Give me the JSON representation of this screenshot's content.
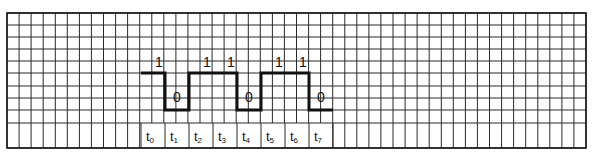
{
  "diagram": {
    "grid": {
      "left": 7,
      "top": 13,
      "right": 586,
      "bottom": 148,
      "col_width": 12.06,
      "row_lines": [
        13,
        25,
        37,
        49,
        61,
        73,
        86,
        98,
        110,
        123,
        148
      ],
      "label_row_top": 123,
      "line_color": "#2a2a2a"
    },
    "signal": {
      "start_x": 141,
      "slot_width": 24,
      "high_y": 73,
      "low_y": 110,
      "color": "#111111",
      "bits": [
        1,
        0,
        1,
        1,
        0,
        1,
        1,
        0
      ]
    },
    "bit_labels": [
      "1",
      "0",
      "1",
      "1",
      "0",
      "1",
      "1",
      "0"
    ],
    "time_labels": [
      {
        "base": "t",
        "sub": "0"
      },
      {
        "base": "t",
        "sub": "1"
      },
      {
        "base": "t",
        "sub": "2"
      },
      {
        "base": "t",
        "sub": "3"
      },
      {
        "base": "t",
        "sub": "4"
      },
      {
        "base": "t",
        "sub": "5"
      },
      {
        "base": "t",
        "sub": "6"
      },
      {
        "base": "t",
        "sub": "7"
      }
    ]
  }
}
